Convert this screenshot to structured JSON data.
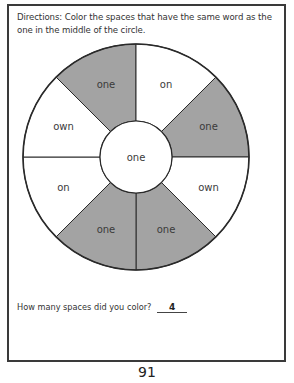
{
  "worksheet": {
    "directions": "Directions: Color the spaces that have the same word as the one in the middle of the circle.",
    "center_word": "one",
    "segments": [
      {
        "word": "one",
        "colored": true
      },
      {
        "word": "on",
        "colored": false
      },
      {
        "word": "one",
        "colored": true
      },
      {
        "word": "own",
        "colored": false
      },
      {
        "word": "one",
        "colored": true
      },
      {
        "word": "one",
        "colored": true
      },
      {
        "word": "on",
        "colored": false
      },
      {
        "word": "own",
        "colored": false
      }
    ],
    "colors": {
      "shaded": "#a3a3a3",
      "unshaded": "#ffffff",
      "outline": "#2a2a2a"
    },
    "question": "How many spaces did you color?",
    "answer": "4",
    "page_number": "91"
  }
}
